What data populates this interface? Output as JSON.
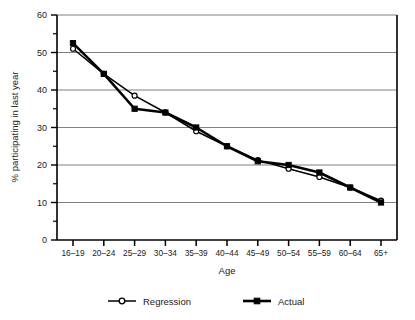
{
  "chart_data": {
    "type": "line",
    "title": "",
    "xlabel": "Age",
    "ylabel": "% participating in last year",
    "categories": [
      "16–19",
      "20–24",
      "25–29",
      "30–34",
      "35–39",
      "40–44",
      "45–49",
      "50–54",
      "55–59",
      "60–64",
      "65+"
    ],
    "series": [
      {
        "name": "Regression",
        "marker": "open-circle",
        "values": [
          51.0,
          44.3,
          38.5,
          34.0,
          29.0,
          25.0,
          21.3,
          19.0,
          16.8,
          14.0,
          10.5
        ]
      },
      {
        "name": "Actual",
        "marker": "filled-square",
        "values": [
          52.5,
          44.3,
          35.0,
          34.0,
          30.0,
          25.0,
          21.0,
          20.0,
          18.0,
          14.0,
          10.0
        ]
      }
    ],
    "ylim": [
      0,
      60
    ],
    "yticks": [
      0,
      10,
      20,
      30,
      40,
      50,
      60
    ],
    "yticks_minor": [
      5,
      15,
      25,
      35,
      45,
      55
    ],
    "ytick_labels": [
      "0",
      "10",
      "20",
      "30",
      "40",
      "50",
      "60"
    ],
    "grid": true,
    "grid_axis": "y",
    "legend_position": "bottom",
    "colors": {
      "series_line": "#000000",
      "grid": "#808080",
      "axis": "#000000",
      "background": "#ffffff"
    }
  },
  "legend": {
    "entries": [
      {
        "label": "Regression",
        "marker": "open-circle"
      },
      {
        "label": "Actual",
        "marker": "filled-square"
      }
    ]
  }
}
